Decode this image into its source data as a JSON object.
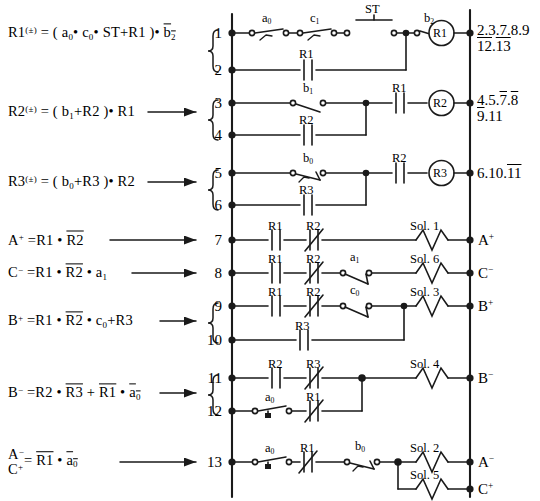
{
  "diagram": {
    "type": "ladder-logic",
    "line_color": "#1a1a1a",
    "background": "#ffffff"
  },
  "equations": [
    {
      "id": "eq-r1",
      "html": "R1<sup>(&#177;)</sup> = ( a<sub>0</sub>&#8226; c<sub>0</sub>&#8226; ST&#43;R1 )&#8226; <span class=\"ov\">b<sub>2</sub></span>",
      "connector": "brace",
      "rungs": "1-2"
    },
    {
      "id": "eq-r2",
      "html": "R2<sup>(&#177;)</sup> =  ( b<sub>1</sub>&#43;R2 )&#8226; R1",
      "connector": "arrow-brace",
      "rungs": "3-4"
    },
    {
      "id": "eq-r3",
      "html": "R3<sup>(&#177;)</sup> =  ( b<sub>0</sub>&#43;R3 )&#8226; R2",
      "connector": "arrow-brace",
      "rungs": "5-6"
    },
    {
      "id": "eq-ap",
      "html": "A<sup>&#43;</sup> =R1 &#8226; <span class=\"ov\">R2</span>",
      "connector": "arrow",
      "rungs": "7"
    },
    {
      "id": "eq-cm",
      "html": "C<sup>&#8722;</sup> =R1 &#8226; <span class=\"ov\">R2</span> &#8226; a<sub>1</sub>",
      "connector": "arrow",
      "rungs": "8"
    },
    {
      "id": "eq-bp",
      "html": "B<sup>&#43;</sup> =R1 &#8226; <span class=\"ov\">R2</span> &#8226; c<sub>0</sub>&#43;R3",
      "connector": "arrow-brace",
      "rungs": "9-10"
    },
    {
      "id": "eq-bm",
      "html": "B<sup>&#8722;</sup> =R2 &#8226; <span class=\"ov\">R3</span> &#43; <span class=\"ov\">R1</span> &#8226; <span class=\"ov\">a<sub>0</sub></span>",
      "connector": "arrow-brace",
      "rungs": "11-12"
    },
    {
      "id": "eq-ac",
      "html": "<span class=\"stack\">A<sup>&#8722;</sup><br>C<sup>&#43;</sup></span>= <span class=\"ov\">R1</span> &#8226; <span class=\"ov\">a<sub>0</sub></span>",
      "connector": "arrow",
      "rungs": "13"
    }
  ],
  "rung_numbers": [
    "1",
    "2",
    "3",
    "4",
    "5",
    "6",
    "7",
    "8",
    "9",
    "10",
    "11",
    "12",
    "13"
  ],
  "cross_references": [
    {
      "coil": "R1",
      "line1": "2.3.7.8.9",
      "line2_html": "<span class=\"ov\">12</span>.<span class=\"ov\">13</span>"
    },
    {
      "coil": "R2",
      "line1_html": "4.5.<span class=\"ov\">7</span>.<span class=\"ov\">8</span>",
      "line2_html": "<span class=\"ov\">9</span>.11"
    },
    {
      "coil": "R3",
      "line1_html": "6.10.<span class=\"ov\">11</span>"
    }
  ],
  "coils": [
    {
      "name": "R1",
      "rung": "1"
    },
    {
      "name": "R2",
      "rung": "3"
    },
    {
      "name": "R3",
      "rung": "5"
    }
  ],
  "solenoids": [
    {
      "name": "Sol. 1",
      "rung": "7",
      "output": "A+"
    },
    {
      "name": "Sol. 6",
      "rung": "8",
      "output": "C-"
    },
    {
      "name": "Sol. 3",
      "rung": "9",
      "output": "B+"
    },
    {
      "name": "Sol. 4",
      "rung": "11",
      "output": "B-"
    },
    {
      "name": "Sol. 2",
      "rung": "13",
      "output": "A-"
    },
    {
      "name": "Sol. 5",
      "rung": "13",
      "output": "C+"
    }
  ],
  "output_labels": [
    {
      "html": "A<sup>&#43;</sup>",
      "rung": "7"
    },
    {
      "html": "C<sup>&#8722;</sup>",
      "rung": "8"
    },
    {
      "html": "B<sup>&#43;</sup>",
      "rung": "9"
    },
    {
      "html": "B<sup>&#8722;</sup>",
      "rung": "11"
    },
    {
      "html": "A<sup>&#8722;</sup>",
      "rung": "13"
    },
    {
      "html": "C<sup>&#43;</sup>",
      "rung": "13b"
    }
  ],
  "contact_labels": [
    {
      "rung": "1",
      "html": "a<sub>0</sub>"
    },
    {
      "rung": "1",
      "html": "c<sub>1</sub>"
    },
    {
      "rung": "1",
      "html": "ST"
    },
    {
      "rung": "1",
      "html": "b<sub>2</sub>"
    },
    {
      "rung": "2",
      "html": "R1"
    },
    {
      "rung": "3",
      "html": "b<sub>1</sub>"
    },
    {
      "rung": "3",
      "html": "R1"
    },
    {
      "rung": "4",
      "html": "R2"
    },
    {
      "rung": "5",
      "html": "b<sub>0</sub>"
    },
    {
      "rung": "5",
      "html": "R2"
    },
    {
      "rung": "6",
      "html": "R3"
    },
    {
      "rung": "7",
      "html": "R1"
    },
    {
      "rung": "7",
      "html": "R2"
    },
    {
      "rung": "8",
      "html": "R1"
    },
    {
      "rung": "8",
      "html": "R2"
    },
    {
      "rung": "8",
      "html": "a<sub>1</sub>"
    },
    {
      "rung": "9",
      "html": "R1"
    },
    {
      "rung": "9",
      "html": "R2"
    },
    {
      "rung": "9",
      "html": "c<sub>0</sub>"
    },
    {
      "rung": "10",
      "html": "R3"
    },
    {
      "rung": "11",
      "html": "R2"
    },
    {
      "rung": "11",
      "html": "R3"
    },
    {
      "rung": "12",
      "html": "a<sub>0</sub>"
    },
    {
      "rung": "12",
      "html": "R1"
    },
    {
      "rung": "13",
      "html": "a<sub>0</sub>"
    },
    {
      "rung": "13",
      "html": "R1"
    },
    {
      "rung": "13",
      "html": "b<sub>0</sub>"
    }
  ]
}
